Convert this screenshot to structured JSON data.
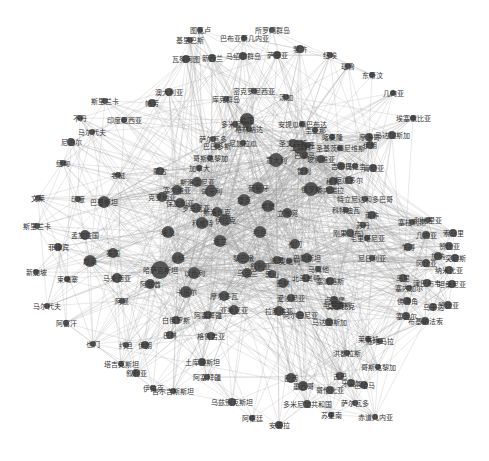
{
  "diagram": {
    "type": "network-graph",
    "node_color": "#555555",
    "edge_color": "#9a9a9a",
    "background": "#ffffff",
    "nodes": [
      {
        "id": "tuvalu",
        "label": "图瓦卢",
        "x": 200,
        "y": 30,
        "r": 3
      },
      {
        "id": "solomon",
        "label": "所罗门群岛",
        "x": 272,
        "y": 30,
        "r": 3
      },
      {
        "id": "png",
        "label": "巴布亚新几内亚",
        "x": 244,
        "y": 38,
        "r": 3
      },
      {
        "id": "kiribati",
        "label": "基里巴斯",
        "x": 190,
        "y": 40,
        "r": 3
      },
      {
        "id": "marshall",
        "label": "马绍尔群岛",
        "x": 243,
        "y": 56,
        "r": 4
      },
      {
        "id": "vanuatu",
        "label": "瓦努阿图",
        "x": 186,
        "y": 59,
        "r": 4
      },
      {
        "id": "fiji",
        "label": "斐济",
        "x": 300,
        "y": 49,
        "r": 4
      },
      {
        "id": "samoa",
        "label": "萨摩亚",
        "x": 277,
        "y": 55,
        "r": 4
      },
      {
        "id": "nz",
        "label": "新西兰",
        "x": 212,
        "y": 58,
        "r": 4
      },
      {
        "id": "australia",
        "label": "澳大利亚",
        "x": 169,
        "y": 92,
        "r": 4
      },
      {
        "id": "cook",
        "label": "库克群岛",
        "x": 226,
        "y": 99,
        "r": 3
      },
      {
        "id": "micronesia",
        "label": "密克罗尼西亚",
        "x": 254,
        "y": 91,
        "r": 3
      },
      {
        "id": "palau",
        "label": "帕劳",
        "x": 152,
        "y": 103,
        "r": 4
      },
      {
        "id": "tonga",
        "label": "汤加",
        "x": 286,
        "y": 97,
        "r": 3
      },
      {
        "id": "niue",
        "label": "纽埃",
        "x": 330,
        "y": 55,
        "r": 3
      },
      {
        "id": "nauru",
        "label": "瑙鲁",
        "x": 348,
        "y": 66,
        "r": 3
      },
      {
        "id": "east_timor",
        "label": "东帝汶",
        "x": 372,
        "y": 75,
        "r": 3
      },
      {
        "id": "guinea_eq",
        "label": "几内亚",
        "x": 393,
        "y": 93,
        "r": 3
      },
      {
        "id": "ethiopia",
        "label": "埃塞俄比亚",
        "x": 413,
        "y": 118,
        "r": 3
      },
      {
        "id": "madagascar",
        "label": "马达加斯加",
        "x": 392,
        "y": 135,
        "r": 4
      },
      {
        "id": "sri_lanka",
        "label": "斯里兰卡",
        "x": 105,
        "y": 101,
        "r": 3
      },
      {
        "id": "indonesia",
        "label": "印度尼西亚",
        "x": 124,
        "y": 120,
        "r": 3
      },
      {
        "id": "maldives",
        "label": "马尔代夫",
        "x": 92,
        "y": 132,
        "r": 3
      },
      {
        "id": "bhutan",
        "label": "不丹",
        "x": 80,
        "y": 118,
        "r": 3
      },
      {
        "id": "nepal",
        "label": "尼泊尔",
        "x": 71,
        "y": 142,
        "r": 4
      },
      {
        "id": "myanmar",
        "label": "缅甸",
        "x": 63,
        "y": 163,
        "r": 3
      },
      {
        "id": "laos",
        "label": "老挝",
        "x": 118,
        "y": 175,
        "r": 3
      },
      {
        "id": "mongolia",
        "label": "蒙古",
        "x": 160,
        "y": 171,
        "r": 4
      },
      {
        "id": "brunei",
        "label": "文莱",
        "x": 38,
        "y": 198,
        "r": 3
      },
      {
        "id": "kazakh2",
        "label": "印度",
        "x": 78,
        "y": 199,
        "r": 3
      },
      {
        "id": "pakistan",
        "label": "巴基斯坦",
        "x": 104,
        "y": 202,
        "r": 6
      },
      {
        "id": "pakistan_sub",
        "label": "斯里兰卡",
        "x": 37,
        "y": 226,
        "r": 3
      },
      {
        "id": "bangladesh",
        "label": "孟加拉国",
        "x": 85,
        "y": 235,
        "r": 5
      },
      {
        "id": "philippines",
        "label": "菲律宾",
        "x": 58,
        "y": 247,
        "r": 4
      },
      {
        "id": "vietnam",
        "label": "越南",
        "x": 90,
        "y": 261,
        "r": 6
      },
      {
        "id": "thailand",
        "label": "泰国",
        "x": 113,
        "y": 253,
        "r": 5
      },
      {
        "id": "singapore",
        "label": "新加坡",
        "x": 36,
        "y": 272,
        "r": 3
      },
      {
        "id": "cambodia",
        "label": "柬埔寨",
        "x": 67,
        "y": 279,
        "r": 3
      },
      {
        "id": "malaysia",
        "label": "马来西亚",
        "x": 117,
        "y": 278,
        "r": 5
      },
      {
        "id": "maldives2",
        "label": "马尔代夫",
        "x": 47,
        "y": 306,
        "r": 3
      },
      {
        "id": "afghanistan",
        "label": "阿富汗",
        "x": 66,
        "y": 323,
        "r": 3
      },
      {
        "id": "oman",
        "label": "阿曼",
        "x": 122,
        "y": 301,
        "r": 3
      },
      {
        "id": "dominica",
        "label": "多米尼加",
        "x": 235,
        "y": 124,
        "r": 3
      },
      {
        "id": "grenada",
        "label": "格林纳达",
        "x": 249,
        "y": 129,
        "r": 3
      },
      {
        "id": "salvador",
        "label": "萨尔瓦多",
        "x": 213,
        "y": 139,
        "r": 3
      },
      {
        "id": "barbados",
        "label": "巴巴多斯",
        "x": 217,
        "y": 146,
        "r": 3
      },
      {
        "id": "nicaragua",
        "label": "尼加拉瓜",
        "x": 243,
        "y": 143,
        "r": 3
      },
      {
        "id": "costa_rica",
        "label": "哥斯达黎加",
        "x": 210,
        "y": 158,
        "r": 3
      },
      {
        "id": "canada",
        "label": "加拿大",
        "x": 199,
        "y": 168,
        "r": 3
      },
      {
        "id": "antigua",
        "label": "安提瓜和巴布达",
        "x": 302,
        "y": 124,
        "r": 3
      },
      {
        "id": "guyana",
        "label": "圭亚那",
        "x": 315,
        "y": 130,
        "r": 3
      },
      {
        "id": "cameroon",
        "label": "喀麦隆",
        "x": 332,
        "y": 137,
        "r": 3
      },
      {
        "id": "morocco",
        "label": "摩洛哥",
        "x": 369,
        "y": 137,
        "r": 4
      },
      {
        "id": "st_vincent",
        "label": "圣文森特",
        "x": 293,
        "y": 143,
        "r": 4
      },
      {
        "id": "gabon",
        "label": "加蓬",
        "x": 308,
        "y": 145,
        "r": 3
      },
      {
        "id": "panama",
        "label": "巴拿马",
        "x": 304,
        "y": 155,
        "r": 4
      },
      {
        "id": "stk",
        "label": "圣基茨和尼维斯",
        "x": 340,
        "y": 148,
        "r": 3
      },
      {
        "id": "djibouti",
        "label": "吉布提",
        "x": 341,
        "y": 166,
        "r": 4
      },
      {
        "id": "bolivia",
        "label": "玻利维亚",
        "x": 321,
        "y": 159,
        "r": 4
      },
      {
        "id": "uruguay",
        "label": "乌拉圭",
        "x": 355,
        "y": 166,
        "r": 3
      },
      {
        "id": "chile",
        "label": "智利",
        "x": 304,
        "y": 171,
        "r": 4
      },
      {
        "id": "peru",
        "label": "秘鲁",
        "x": 333,
        "y": 181,
        "r": 4
      },
      {
        "id": "ecuador",
        "label": "厄瓜多尔",
        "x": 349,
        "y": 180,
        "r": 4
      },
      {
        "id": "venezuela",
        "label": "委内瑞拉",
        "x": 330,
        "y": 190,
        "r": 4
      },
      {
        "id": "trinidad",
        "label": "特立尼达和多巴哥",
        "x": 365,
        "y": 199,
        "r": 3
      },
      {
        "id": "cote",
        "label": "科特迪瓦",
        "x": 346,
        "y": 210,
        "r": 3
      },
      {
        "id": "russia",
        "label": "俄罗斯",
        "x": 311,
        "y": 189,
        "r": 7
      },
      {
        "id": "south_africa",
        "label": "南非",
        "x": 372,
        "y": 215,
        "r": 4
      },
      {
        "id": "kenya",
        "label": "肯尼亚",
        "x": 373,
        "y": 168,
        "r": 4
      },
      {
        "id": "korea",
        "label": "韩国",
        "x": 247,
        "y": 120,
        "r": 7
      },
      {
        "id": "turkey",
        "label": "土耳其",
        "x": 300,
        "y": 147,
        "r": 7
      },
      {
        "id": "iran",
        "label": "伊朗",
        "x": 370,
        "y": 145,
        "r": 4
      },
      {
        "id": "congo",
        "label": "刚果（布）",
        "x": 350,
        "y": 233,
        "r": 4
      },
      {
        "id": "mauritania",
        "label": "毛里塔尼亚",
        "x": 367,
        "y": 238,
        "r": 3
      },
      {
        "id": "sudan",
        "label": "苏丹",
        "x": 363,
        "y": 225,
        "r": 3
      },
      {
        "id": "nigeria",
        "label": "尼日利亚",
        "x": 372,
        "y": 258,
        "r": 3
      },
      {
        "id": "sierra",
        "label": "塞拉利昂",
        "x": 412,
        "y": 222,
        "r": 3
      },
      {
        "id": "guinea2",
        "label": "几内亚",
        "x": 426,
        "y": 235,
        "r": 4
      },
      {
        "id": "chad",
        "label": "乍得",
        "x": 408,
        "y": 247,
        "r": 4
      },
      {
        "id": "liberia",
        "label": "利比里亚",
        "x": 428,
        "y": 220,
        "r": 3
      },
      {
        "id": "somalia",
        "label": "索马里",
        "x": 453,
        "y": 233,
        "r": 4
      },
      {
        "id": "gambia",
        "label": "冈比亚",
        "x": 426,
        "y": 263,
        "r": 4
      },
      {
        "id": "tunisia",
        "label": "突尼斯",
        "x": 455,
        "y": 258,
        "r": 4
      },
      {
        "id": "ghana",
        "label": "加纳",
        "x": 438,
        "y": 256,
        "r": 4
      },
      {
        "id": "zambia",
        "label": "赞比亚",
        "x": 449,
        "y": 246,
        "r": 4
      },
      {
        "id": "senegal",
        "label": "塞内加尔",
        "x": 409,
        "y": 288,
        "r": 3
      },
      {
        "id": "mali",
        "label": "马里",
        "x": 403,
        "y": 278,
        "r": 4
      },
      {
        "id": "zimbabwe",
        "label": "津巴布韦",
        "x": 427,
        "y": 283,
        "r": 4
      },
      {
        "id": "cape_verde",
        "label": "佛得角",
        "x": 407,
        "y": 301,
        "r": 4
      },
      {
        "id": "burkina",
        "label": "布基纳法索",
        "x": 425,
        "y": 321,
        "r": 4
      },
      {
        "id": "somalia2",
        "label": "塞舌尔",
        "x": 406,
        "y": 316,
        "r": 4
      },
      {
        "id": "namibia",
        "label": "纳米比亚",
        "x": 449,
        "y": 270,
        "r": 4
      },
      {
        "id": "tanzania",
        "label": "坦桑尼亚",
        "x": 452,
        "y": 284,
        "r": 4
      },
      {
        "id": "zambia2",
        "label": "赞比亚",
        "x": 448,
        "y": 305,
        "r": 4
      },
      {
        "id": "uganda",
        "label": "乌干达",
        "x": 433,
        "y": 307,
        "r": 4
      },
      {
        "id": "kazakhstan",
        "label": "哈萨克斯坦",
        "x": 160,
        "y": 270,
        "r": 9
      },
      {
        "id": "uae",
        "label": "阿联酋",
        "x": 150,
        "y": 284,
        "r": 5
      },
      {
        "id": "saudi",
        "label": "沙特",
        "x": 178,
        "y": 258,
        "r": 6
      },
      {
        "id": "israel",
        "label": "以色列",
        "x": 194,
        "y": 273,
        "r": 6
      },
      {
        "id": "qatar",
        "label": "卡塔尔",
        "x": 186,
        "y": 292,
        "r": 6
      },
      {
        "id": "egypt",
        "label": "埃及",
        "x": 168,
        "y": 232,
        "r": 6
      },
      {
        "id": "kuwait",
        "label": "科威特",
        "x": 202,
        "y": 223,
        "r": 6
      },
      {
        "id": "iraq",
        "label": "伊拉克",
        "x": 225,
        "y": 220,
        "r": 6
      },
      {
        "id": "jordan",
        "label": "约旦",
        "x": 260,
        "y": 232,
        "r": 6
      },
      {
        "id": "lebanon",
        "label": "黎巴嫩",
        "x": 243,
        "y": 258,
        "r": 6
      },
      {
        "id": "syria",
        "label": "叙利亚",
        "x": 260,
        "y": 266,
        "r": 6
      },
      {
        "id": "yemen",
        "label": "也门",
        "x": 295,
        "y": 244,
        "r": 5
      },
      {
        "id": "bahrain",
        "label": "巴林",
        "x": 283,
        "y": 283,
        "r": 5
      },
      {
        "id": "palestine",
        "label": "巴勒斯坦",
        "x": 307,
        "y": 258,
        "r": 5
      },
      {
        "id": "poland",
        "label": "波兰",
        "x": 220,
        "y": 241,
        "r": 6
      },
      {
        "id": "czech",
        "label": "捷克",
        "x": 244,
        "y": 200,
        "r": 6
      },
      {
        "id": "hungary",
        "label": "匈牙利",
        "x": 211,
        "y": 191,
        "r": 6
      },
      {
        "id": "slovakia",
        "label": "斯洛伐克",
        "x": 217,
        "y": 212,
        "r": 5
      },
      {
        "id": "romania",
        "label": "罗马尼亚",
        "x": 196,
        "y": 208,
        "r": 5
      },
      {
        "id": "bulgaria",
        "label": "保加利亚",
        "x": 180,
        "y": 203,
        "r": 5
      },
      {
        "id": "serbia",
        "label": "塞尔维亚",
        "x": 177,
        "y": 190,
        "r": 5
      },
      {
        "id": "croatia",
        "label": "克罗地亚",
        "x": 162,
        "y": 197,
        "r": 5
      },
      {
        "id": "slovenia",
        "label": "斯洛文尼亚",
        "x": 197,
        "y": 182,
        "r": 5
      },
      {
        "id": "italy",
        "label": "意大利",
        "x": 276,
        "y": 160,
        "r": 7
      },
      {
        "id": "portugal",
        "label": "葡萄牙",
        "x": 258,
        "y": 188,
        "r": 6
      },
      {
        "id": "greece",
        "label": "希腊",
        "x": 268,
        "y": 206,
        "r": 6
      },
      {
        "id": "lithuania",
        "label": "立陶宛",
        "x": 287,
        "y": 213,
        "r": 5
      },
      {
        "id": "ukraine",
        "label": "乌克兰",
        "x": 247,
        "y": 273,
        "r": 5
      },
      {
        "id": "belarus",
        "label": "白俄罗斯",
        "x": 176,
        "y": 320,
        "r": 4
      },
      {
        "id": "georgia",
        "label": "格鲁吉亚",
        "x": 211,
        "y": 336,
        "r": 4
      },
      {
        "id": "armenia",
        "label": "亚美尼亚",
        "x": 234,
        "y": 310,
        "r": 5
      },
      {
        "id": "azerbaijan",
        "label": "阿塞拜疆",
        "x": 208,
        "y": 315,
        "r": 4
      },
      {
        "id": "moldova",
        "label": "摩尔多瓦",
        "x": 224,
        "y": 296,
        "r": 5
      },
      {
        "id": "estonia",
        "label": "爱沙尼亚",
        "x": 291,
        "y": 298,
        "r": 4
      },
      {
        "id": "latvia",
        "label": "拉脱维亚",
        "x": 279,
        "y": 311,
        "r": 5
      },
      {
        "id": "albania",
        "label": "阿尔巴尼亚",
        "x": 300,
        "y": 315,
        "r": 4
      },
      {
        "id": "montenegro",
        "label": "黑山",
        "x": 272,
        "y": 274,
        "r": 4
      },
      {
        "id": "n_macedonia",
        "label": "北马其顿",
        "x": 306,
        "y": 278,
        "r": 4
      },
      {
        "id": "bosnia",
        "label": "波黑",
        "x": 277,
        "y": 260,
        "r": 4
      },
      {
        "id": "cyprus",
        "label": "塞浦路斯",
        "x": 330,
        "y": 281,
        "r": 4
      },
      {
        "id": "malta",
        "label": "马耳他",
        "x": 318,
        "y": 269,
        "r": 3
      },
      {
        "id": "austria",
        "label": "奥地利",
        "x": 289,
        "y": 261,
        "r": 3
      },
      {
        "id": "luxembourg",
        "label": "卢森堡",
        "x": 334,
        "y": 300,
        "r": 4
      },
      {
        "id": "tajikistan",
        "label": "塔吉克斯坦",
        "x": 121,
        "y": 364,
        "r": 3
      },
      {
        "id": "turkmenistan",
        "label": "土库曼斯坦",
        "x": 202,
        "y": 362,
        "r": 4
      },
      {
        "id": "kyrgyzstan",
        "label": "吉尔吉斯斯坦",
        "x": 173,
        "y": 391,
        "r": 3
      },
      {
        "id": "uzbekistan",
        "label": "乌兹别克斯坦",
        "x": 232,
        "y": 402,
        "r": 4
      },
      {
        "id": "afghan2",
        "label": "阿塞拜疆",
        "x": 207,
        "y": 377,
        "r": 3
      },
      {
        "id": "qatar2",
        "label": "伊拉克",
        "x": 153,
        "y": 388,
        "r": 3
      },
      {
        "id": "iran2",
        "label": "伊朗",
        "x": 145,
        "y": 345,
        "r": 4
      },
      {
        "id": "bahrain2",
        "label": "巴林",
        "x": 170,
        "y": 335,
        "r": 4
      },
      {
        "id": "kuwait2",
        "label": "叙利亚",
        "x": 136,
        "y": 373,
        "r": 4
      },
      {
        "id": "syria2",
        "label": "也门",
        "x": 93,
        "y": 344,
        "r": 3
      },
      {
        "id": "lebanon2",
        "label": "约旦",
        "x": 126,
        "y": 345,
        "r": 3
      },
      {
        "id": "argentina",
        "label": "阿根廷",
        "x": 252,
        "y": 418,
        "r": 3
      },
      {
        "id": "mexico",
        "label": "墨西哥",
        "x": 303,
        "y": 386,
        "r": 5
      },
      {
        "id": "brazil",
        "label": "巴西",
        "x": 291,
        "y": 378,
        "r": 5
      },
      {
        "id": "colombia",
        "label": "哥伦比亚",
        "x": 330,
        "y": 390,
        "r": 4
      },
      {
        "id": "cuba",
        "label": "古巴",
        "x": 340,
        "y": 376,
        "r": 4
      },
      {
        "id": "jamaica",
        "label": "牙买加",
        "x": 351,
        "y": 383,
        "r": 4
      },
      {
        "id": "dominican_r",
        "label": "多米尼加共和国",
        "x": 307,
        "y": 404,
        "r": 4
      },
      {
        "id": "surinam",
        "label": "苏里南",
        "x": 331,
        "y": 415,
        "r": 3
      },
      {
        "id": "el_salv",
        "label": "萨尔瓦多",
        "x": 355,
        "y": 403,
        "r": 3
      },
      {
        "id": "honduras",
        "label": "洪都拉斯",
        "x": 347,
        "y": 353,
        "r": 3
      },
      {
        "id": "costa2",
        "label": "哥斯达黎加",
        "x": 378,
        "y": 367,
        "r": 3
      },
      {
        "id": "guatemala",
        "label": "危地马拉",
        "x": 380,
        "y": 341,
        "r": 3
      },
      {
        "id": "bahamas",
        "label": "巴哈马",
        "x": 364,
        "y": 385,
        "r": 4
      },
      {
        "id": "equador2",
        "label": "赤道几内亚",
        "x": 375,
        "y": 417,
        "r": 3
      },
      {
        "id": "mozambique",
        "label": "莫桑比克",
        "x": 341,
        "y": 306,
        "r": 3
      },
      {
        "id": "lesotho",
        "label": "莱索托",
        "x": 368,
        "y": 339,
        "r": 3
      },
      {
        "id": "trinidad2",
        "label": "马达加斯加",
        "x": 329,
        "y": 322,
        "r": 4
      },
      {
        "id": "mauritius",
        "label": "毛里求斯",
        "x": 337,
        "y": 305,
        "r": 5
      },
      {
        "id": "angola",
        "label": "安哥拉",
        "x": 279,
        "y": 425,
        "r": 4
      }
    ],
    "edges_description": "dense undirected edges connecting nodes, drawn as thin semi-transparent gray lines"
  }
}
